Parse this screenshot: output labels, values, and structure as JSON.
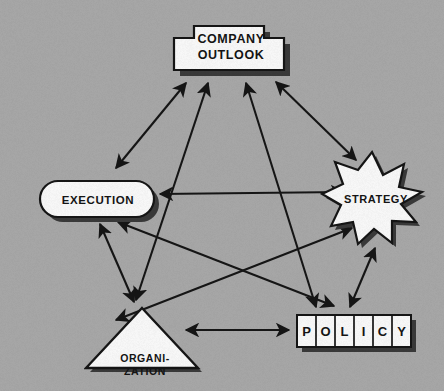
{
  "diagram": {
    "background_color": "#a9a9a9",
    "shape_fill": "#fbfbfb",
    "shape_stroke": "#151515",
    "shadow_color": "#3a3a3a",
    "arrow_color": "#151515",
    "nodes": [
      {
        "id": "company-outlook",
        "label_line1": "COMPANY",
        "label_line2": "OUTLOOK",
        "shape": "stepped-plaque",
        "x": 168,
        "y": 18,
        "w": 122,
        "h": 56
      },
      {
        "id": "execution",
        "label_line1": "EXECUTION",
        "label_line2": "",
        "shape": "stadium",
        "x": 33,
        "y": 176,
        "w": 122,
        "h": 42
      },
      {
        "id": "strategy",
        "label_line1": "STRATEGY",
        "label_line2": "",
        "shape": "star-8",
        "x": 322,
        "y": 150,
        "w": 104,
        "h": 96
      },
      {
        "id": "organization",
        "label_line1": "ORGANI-",
        "label_line2": "ZATION",
        "shape": "triangle",
        "x": 86,
        "y": 304,
        "w": 114,
        "h": 68
      },
      {
        "id": "policy",
        "label_line1": "POLICY",
        "label_line2": "",
        "shape": "letter-boxes",
        "letters": [
          "P",
          "O",
          "L",
          "I",
          "C",
          "Y"
        ],
        "x": 295,
        "y": 313,
        "w": 116,
        "h": 37
      }
    ],
    "edges": [
      {
        "id": "edge-execution-company-outlook",
        "from": "execution",
        "to": "company-outlook",
        "arrows": "both"
      },
      {
        "id": "edge-organization-company-outlook",
        "from": "organization",
        "to": "company-outlook",
        "arrows": "both"
      },
      {
        "id": "edge-policy-company-outlook",
        "from": "policy",
        "to": "company-outlook",
        "arrows": "both"
      },
      {
        "id": "edge-strategy-company-outlook",
        "from": "strategy",
        "to": "company-outlook",
        "arrows": "both"
      },
      {
        "id": "edge-execution-strategy",
        "from": "execution",
        "to": "strategy",
        "arrows": "both"
      },
      {
        "id": "edge-execution-organization",
        "from": "execution",
        "to": "organization",
        "arrows": "both"
      },
      {
        "id": "edge-execution-policy",
        "from": "execution",
        "to": "policy",
        "arrows": "both"
      },
      {
        "id": "edge-organization-strategy",
        "from": "organization",
        "to": "strategy",
        "arrows": "both"
      },
      {
        "id": "edge-organization-policy",
        "from": "organization",
        "to": "policy",
        "arrows": "both"
      },
      {
        "id": "edge-strategy-policy",
        "from": "strategy",
        "to": "policy",
        "arrows": "both"
      }
    ]
  }
}
